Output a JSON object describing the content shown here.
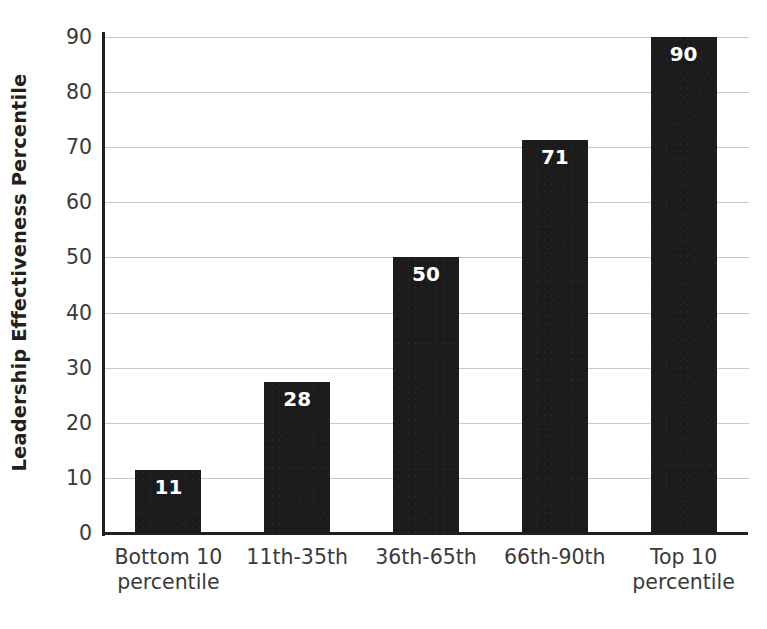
{
  "chart_data": {
    "type": "bar",
    "title": "",
    "subtitle": "",
    "xlabel": "",
    "ylabel": "Leadership Effectiveness Percentile",
    "categories": [
      "Bottom 10 percentile",
      "11th-35th",
      "36th-65th",
      "66th-90th",
      "Top 10 percentile"
    ],
    "category_lines": [
      [
        "Bottom 10",
        "percentile"
      ],
      [
        "11th-35th",
        ""
      ],
      [
        "36th-65th",
        ""
      ],
      [
        "66th-90th",
        ""
      ],
      [
        "Top 10",
        "percentile"
      ]
    ],
    "values": [
      11,
      28,
      50,
      71,
      90
    ],
    "bar_plot_values": [
      11.5,
      27.4,
      50.0,
      71.3,
      90.0
    ],
    "data_labels": [
      "11",
      "28",
      "50",
      "71",
      "90"
    ],
    "ylim": [
      0,
      90
    ],
    "ytick_values": [
      0,
      10,
      20,
      30,
      40,
      50,
      60,
      70,
      80,
      90
    ],
    "ytick_labels": [
      "0",
      "10",
      "20",
      "30",
      "40",
      "50",
      "60",
      "70",
      "80",
      "90"
    ],
    "grid": true,
    "grid_axis": "y",
    "legend": false,
    "legend_position": "none",
    "colors": {
      "bar_fill": "#1b1b1b",
      "data_label_text": "#ffffff",
      "gridline": "#c9c9c9",
      "axis_line": "#231f20",
      "tick_label_text": "#3a3a3a",
      "axis_title_text": "#231f20",
      "background": "#ffffff"
    }
  }
}
